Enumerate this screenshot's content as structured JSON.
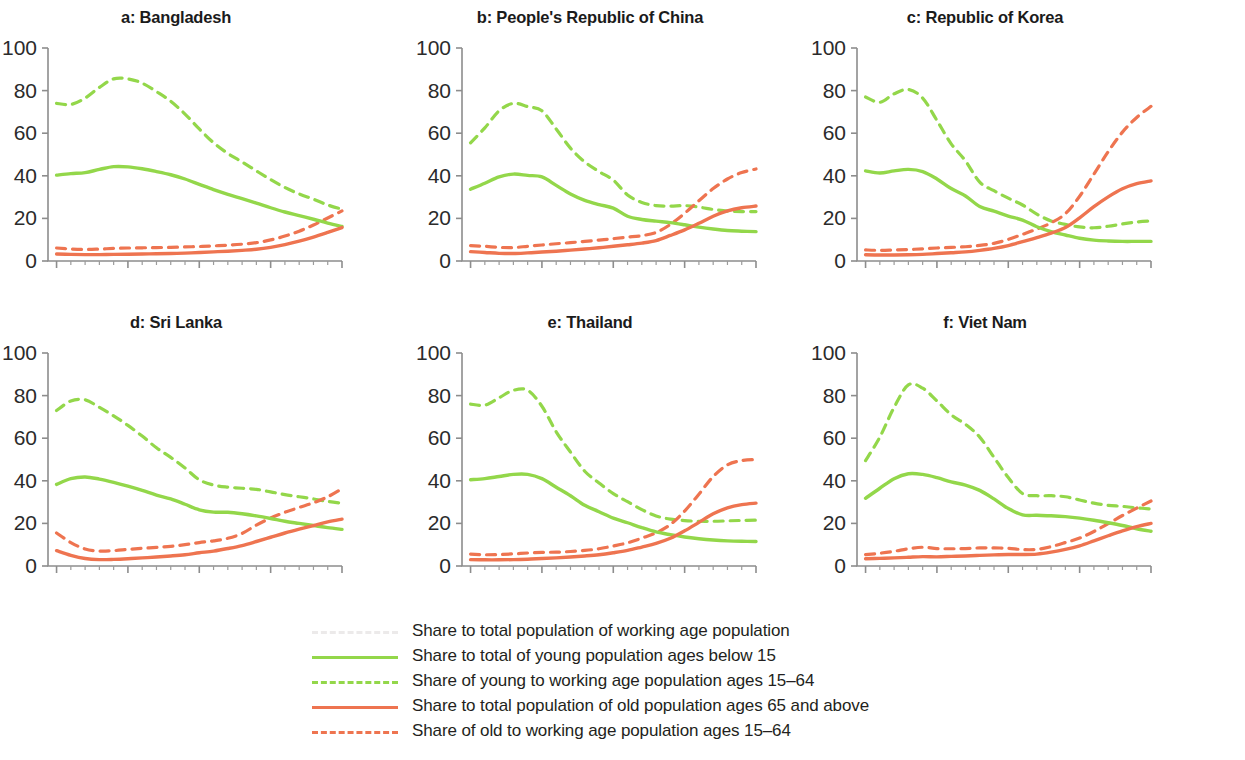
{
  "figure": {
    "panel_order": [
      "a",
      "b",
      "c",
      "d",
      "e",
      "f"
    ],
    "y_axis": {
      "ticks": [
        "0",
        "20",
        "40",
        "60",
        "80",
        "100"
      ],
      "min": 0,
      "max": 100
    },
    "x_axis": {
      "ticks": [
        "1950",
        "1975",
        "2000",
        "2025",
        "2050"
      ],
      "min": 1947,
      "max": 2050,
      "minor_tick_step": 5
    }
  },
  "colors": {
    "green": "#93d74a",
    "orange": "#ee7450",
    "faint_gray": "#eceaea",
    "axis": "#8d8d8d",
    "text": "#231f20"
  },
  "legend": {
    "items": [
      {
        "label": "Share to total population of working age population",
        "color_key": "faint_gray",
        "style": "dashed",
        "swatch_name": "legend-swatch-working-age"
      },
      {
        "label": "Share to total of young population ages below 15",
        "color_key": "green",
        "style": "solid",
        "swatch_name": "legend-swatch-young-share-total"
      },
      {
        "label": "Share of young to working age population ages 15–64",
        "color_key": "green",
        "style": "dashed",
        "swatch_name": "legend-swatch-young-to-working"
      },
      {
        "label": "Share to total population of old population ages 65 and above",
        "color_key": "orange",
        "style": "solid",
        "swatch_name": "legend-swatch-old-share-total"
      },
      {
        "label": "Share of old to working age population ages 15–64",
        "color_key": "orange",
        "style": "dashed",
        "swatch_name": "legend-swatch-old-to-working"
      }
    ]
  },
  "chart_data": {
    "type": "line",
    "title": "",
    "xlabel": "",
    "ylabel": "",
    "xlim": [
      1947,
      2050
    ],
    "ylim": [
      0,
      100
    ],
    "grid": false,
    "legend_position": "bottom",
    "x": [
      1950,
      1955,
      1960,
      1965,
      1970,
      1975,
      1980,
      1985,
      1990,
      1995,
      2000,
      2005,
      2010,
      2015,
      2020,
      2025,
      2030,
      2035,
      2040,
      2045,
      2050
    ],
    "panels": [
      {
        "key": "a",
        "title": "a: Bangladesh",
        "series": [
          {
            "name": "Share to total of young population ages below 15",
            "color_key": "green",
            "style": "solid",
            "values": [
              40.3,
              41.0,
              41.5,
              43.0,
              44.3,
              44.2,
              43.3,
              42.0,
              40.5,
              38.5,
              36.0,
              33.5,
              31.3,
              29.3,
              27.2,
              25.0,
              23.0,
              21.3,
              19.6,
              17.8,
              16.2
            ]
          },
          {
            "name": "Share of young to working age population ages 15–64",
            "color_key": "green",
            "style": "dashed",
            "values": [
              74.0,
              73.5,
              76.5,
              81.5,
              85.5,
              85.5,
              83.5,
              79.5,
              75.0,
              69.0,
              62.0,
              55.5,
              50.5,
              46.5,
              42.3,
              38.2,
              34.5,
              31.5,
              29.0,
              26.3,
              24.3
            ]
          },
          {
            "name": "Share to total population of old population ages 65 and above",
            "color_key": "orange",
            "style": "solid",
            "values": [
              3.3,
              3.1,
              3.0,
              3.0,
              3.1,
              3.2,
              3.3,
              3.4,
              3.5,
              3.7,
              4.0,
              4.3,
              4.6,
              5.0,
              5.5,
              6.4,
              7.7,
              9.3,
              11.2,
              13.4,
              15.7
            ]
          },
          {
            "name": "Share of old to working age population ages 15–64",
            "color_key": "orange",
            "style": "dashed",
            "values": [
              6.1,
              5.6,
              5.4,
              5.6,
              5.9,
              6.1,
              6.2,
              6.3,
              6.4,
              6.6,
              6.8,
              7.1,
              7.4,
              7.9,
              8.6,
              9.9,
              11.7,
              14.0,
              16.9,
              20.2,
              23.5
            ]
          }
        ]
      },
      {
        "key": "b",
        "title": "b: People's Republic of China",
        "series": [
          {
            "name": "Share to total of young population ages below 15",
            "color_key": "green",
            "style": "solid",
            "values": [
              33.7,
              36.5,
              39.5,
              40.8,
              40.2,
              39.5,
              35.5,
              31.5,
              28.5,
              26.5,
              24.8,
              21.0,
              19.5,
              18.7,
              18.0,
              17.0,
              15.9,
              15.0,
              14.3,
              14.0,
              13.8
            ]
          },
          {
            "name": "Share of young to working age population ages 15–64",
            "color_key": "green",
            "style": "dashed",
            "values": [
              55.5,
              62.5,
              70.5,
              74.0,
              72.5,
              70.5,
              62.0,
              53.0,
              46.5,
              42.0,
              38.0,
              31.0,
              27.5,
              26.0,
              25.8,
              26.0,
              25.3,
              24.2,
              23.4,
              23.2,
              23.2
            ]
          },
          {
            "name": "Share to total population of old population ages 65 and above",
            "color_key": "orange",
            "style": "solid",
            "values": [
              4.4,
              4.0,
              3.6,
              3.5,
              3.8,
              4.2,
              4.6,
              5.1,
              5.6,
              6.2,
              6.9,
              7.6,
              8.4,
              9.6,
              12.0,
              14.6,
              17.7,
              21.0,
              23.5,
              25.0,
              25.8
            ]
          },
          {
            "name": "Share of old to working age population ages 15–64",
            "color_key": "orange",
            "style": "dashed",
            "values": [
              7.2,
              6.9,
              6.4,
              6.3,
              6.9,
              7.5,
              8.1,
              8.6,
              9.2,
              9.8,
              10.5,
              11.2,
              11.9,
              13.4,
              17.2,
              22.4,
              28.3,
              34.0,
              38.5,
              41.5,
              43.2
            ]
          }
        ]
      },
      {
        "key": "c",
        "title": "c: Republic of Korea",
        "series": [
          {
            "name": "Share to total of young population ages below 15",
            "color_key": "green",
            "style": "solid",
            "values": [
              42.3,
              41.3,
              42.3,
              43.0,
              42.0,
              38.5,
              34.0,
              30.5,
              25.6,
              23.4,
              21.1,
              19.2,
              16.1,
              13.8,
              12.2,
              10.7,
              9.8,
              9.4,
              9.2,
              9.2,
              9.2
            ]
          },
          {
            "name": "Share of young to working age population ages 15–64",
            "color_key": "green",
            "style": "dashed",
            "values": [
              77.0,
              74.5,
              78.5,
              80.5,
              76.5,
              66.0,
              55.0,
              47.0,
              37.0,
              33.0,
              29.5,
              26.3,
              22.0,
              18.8,
              17.2,
              16.0,
              15.6,
              16.3,
              17.4,
              18.3,
              18.8
            ]
          },
          {
            "name": "Share to total population of old population ages 65 and above",
            "color_key": "orange",
            "style": "solid",
            "values": [
              2.9,
              2.8,
              2.8,
              2.9,
              3.1,
              3.5,
              3.9,
              4.3,
              5.0,
              5.9,
              7.2,
              9.1,
              11.0,
              13.1,
              15.7,
              20.3,
              25.5,
              30.1,
              33.9,
              36.3,
              37.6
            ]
          },
          {
            "name": "Share of old to working age population ages 15–64",
            "color_key": "orange",
            "style": "dashed",
            "values": [
              5.2,
              5.0,
              5.2,
              5.4,
              5.7,
              6.1,
              6.4,
              6.7,
              7.3,
              8.3,
              10.1,
              12.5,
              15.0,
              17.9,
              22.2,
              30.4,
              40.8,
              51.3,
              60.5,
              67.4,
              72.6
            ]
          }
        ]
      },
      {
        "key": "d",
        "title": "d: Sri Lanka",
        "series": [
          {
            "name": "Share to total of young population ages below 15",
            "color_key": "green",
            "style": "solid",
            "values": [
              38.3,
              41.0,
              41.8,
              40.8,
              39.3,
              37.5,
              35.5,
              33.3,
              31.5,
              29.0,
              26.4,
              25.3,
              25.2,
              24.5,
              23.5,
              22.3,
              21.0,
              20.0,
              19.0,
              18.0,
              17.2
            ]
          },
          {
            "name": "Share of young to working age population ages 15–64",
            "color_key": "green",
            "style": "dashed",
            "values": [
              73.0,
              77.5,
              78.0,
              74.5,
              70.5,
              66.0,
              61.0,
              55.5,
              51.0,
              46.0,
              40.5,
              38.0,
              37.0,
              36.5,
              36.0,
              34.8,
              33.5,
              32.5,
              31.5,
              30.3,
              29.5
            ]
          },
          {
            "name": "Share to total population of old population ages 65 and above",
            "color_key": "orange",
            "style": "solid",
            "values": [
              7.2,
              5.0,
              3.5,
              3.0,
              3.1,
              3.4,
              3.8,
              4.2,
              4.7,
              5.3,
              6.2,
              7.0,
              8.2,
              9.6,
              11.5,
              13.5,
              15.5,
              17.3,
              19.0,
              20.7,
              22.0
            ]
          },
          {
            "name": "Share of old to working age population ages 15–64",
            "color_key": "orange",
            "style": "dashed",
            "values": [
              15.5,
              11.0,
              8.0,
              7.0,
              7.2,
              7.8,
              8.3,
              8.7,
              9.2,
              10.0,
              11.0,
              11.8,
              13.0,
              15.3,
              19.2,
              22.5,
              25.2,
              27.5,
              29.7,
              32.5,
              36.3
            ]
          }
        ]
      },
      {
        "key": "e",
        "title": "e: Thailand",
        "series": [
          {
            "name": "Share to total of young population ages below 15",
            "color_key": "green",
            "style": "solid",
            "values": [
              40.5,
              41.0,
              42.0,
              43.0,
              43.0,
              41.0,
              37.0,
              33.0,
              28.5,
              25.5,
              22.5,
              20.3,
              18.0,
              16.0,
              14.7,
              13.6,
              12.8,
              12.2,
              11.8,
              11.6,
              11.5
            ]
          },
          {
            "name": "Share of young to working age population ages 15–64",
            "color_key": "green",
            "style": "dashed",
            "values": [
              76.0,
              75.5,
              79.0,
              82.5,
              82.5,
              75.0,
              63.0,
              53.5,
              44.5,
              39.0,
              34.0,
              30.2,
              26.5,
              23.5,
              22.0,
              21.3,
              21.0,
              21.0,
              21.2,
              21.4,
              21.5
            ]
          },
          {
            "name": "Share to total population of old population ages 65 and above",
            "color_key": "orange",
            "style": "solid",
            "values": [
              3.0,
              2.9,
              2.9,
              3.0,
              3.2,
              3.5,
              3.8,
              4.2,
              4.7,
              5.3,
              6.2,
              7.3,
              8.9,
              10.6,
              13.0,
              16.5,
              20.5,
              24.5,
              27.3,
              28.8,
              29.5
            ]
          },
          {
            "name": "Share of old to working age population ages 15–64",
            "color_key": "orange",
            "style": "dashed",
            "values": [
              5.6,
              5.3,
              5.4,
              5.7,
              6.1,
              6.4,
              6.5,
              6.8,
              7.3,
              8.1,
              9.4,
              10.9,
              13.1,
              15.6,
              19.5,
              25.8,
              33.7,
              42.0,
              47.5,
              49.5,
              50.0
            ]
          }
        ]
      },
      {
        "key": "f",
        "title": "f: Viet Nam",
        "series": [
          {
            "name": "Share to total of young population ages below 15",
            "color_key": "green",
            "style": "solid",
            "values": [
              31.8,
              36.5,
              41.0,
              43.3,
              43.0,
              41.5,
              39.5,
              38.0,
              35.5,
              31.5,
              27.0,
              24.0,
              23.8,
              23.6,
              23.2,
              22.5,
              21.5,
              20.3,
              19.0,
              17.5,
              16.3
            ]
          },
          {
            "name": "Share of young to working age population ages 15–64",
            "color_key": "green",
            "style": "dashed",
            "values": [
              49.5,
              60.5,
              74.5,
              85.0,
              83.5,
              77.5,
              71.0,
              66.5,
              60.5,
              51.0,
              41.5,
              34.0,
              33.0,
              33.0,
              32.5,
              31.0,
              29.5,
              28.5,
              28.0,
              27.3,
              26.8
            ]
          },
          {
            "name": "Share to total population of old population ages 65 and above",
            "color_key": "orange",
            "style": "solid",
            "values": [
              3.4,
              3.6,
              3.8,
              4.1,
              4.4,
              4.3,
              4.5,
              4.7,
              5.0,
              5.2,
              5.4,
              5.4,
              5.6,
              6.5,
              7.8,
              9.5,
              11.8,
              14.2,
              16.5,
              18.5,
              20.0
            ]
          },
          {
            "name": "Share of old to working age population ages 15–64",
            "color_key": "orange",
            "style": "dashed",
            "values": [
              5.3,
              6.0,
              6.9,
              8.1,
              8.8,
              8.2,
              8.1,
              8.2,
              8.5,
              8.5,
              8.3,
              7.7,
              7.8,
              9.1,
              11.0,
              13.1,
              16.2,
              19.9,
              23.7,
              27.2,
              30.5
            ]
          }
        ]
      }
    ]
  }
}
